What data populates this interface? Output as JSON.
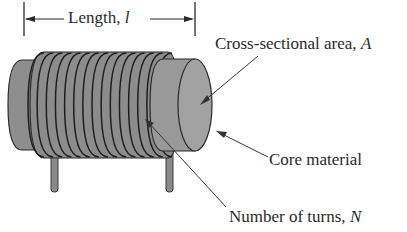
{
  "diagram": {
    "dimension": {
      "label": "Length, ",
      "symbol": "l"
    },
    "labels": {
      "area": {
        "text": "Cross-sectional area, ",
        "symbol": "A"
      },
      "core": {
        "text": "Core material"
      },
      "turns": {
        "text": "Number of turns, ",
        "symbol": "N"
      }
    },
    "colors": {
      "body": "#8c8c8c",
      "body_light": "#a4a4a4",
      "outline": "#2b2b2b",
      "text": "#2a2a2a"
    },
    "winding_count": 15
  }
}
